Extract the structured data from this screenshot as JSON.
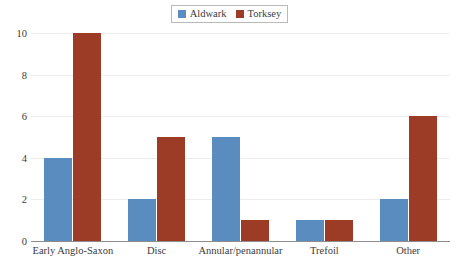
{
  "chart_data": {
    "type": "bar",
    "title": "",
    "subtitle": "",
    "xlabel": "",
    "ylabel": "",
    "categories": [
      "Early Anglo-Saxon",
      "Disc",
      "Annular/penannular",
      "Trefoil",
      "Other"
    ],
    "series": [
      {
        "name": "Aldwark",
        "color": "#5B8CC0",
        "values": [
          4,
          2,
          5,
          1,
          2
        ]
      },
      {
        "name": "Torksey",
        "color": "#9C3B26",
        "values": [
          10,
          5,
          1,
          1,
          6
        ]
      }
    ],
    "ylim": [
      0,
      10
    ],
    "ytick_values": [
      0,
      2,
      4,
      6,
      8,
      10
    ],
    "ytick_labels": [
      "0",
      "2",
      "4",
      "6",
      "8",
      "10"
    ],
    "grid": "horizontal",
    "legend_position": "top-center",
    "grid_color": "#ececec",
    "axis_color": "#8d8d8d",
    "background": "#ffffff"
  }
}
